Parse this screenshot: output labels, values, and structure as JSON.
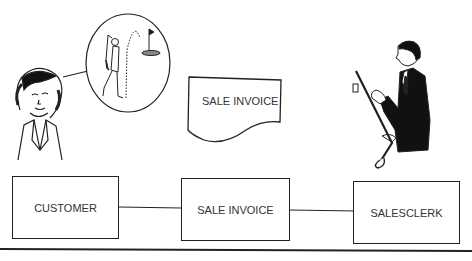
{
  "diagram": {
    "document_symbol": {
      "label": "SALE INVOICE"
    },
    "entities": [
      {
        "id": "customer",
        "label": "CUSTOMER"
      },
      {
        "id": "sale-invoice",
        "label": "SALE INVOICE"
      },
      {
        "id": "salesclerk",
        "label": "SALESCLERK"
      }
    ],
    "illustrations": [
      {
        "id": "customer-woman",
        "icon": "woman-portrait-icon"
      },
      {
        "id": "golfer-thought-bubble",
        "icon": "golfer-icon"
      },
      {
        "id": "salesclerk-man",
        "icon": "salesman-with-golf-club-icon"
      }
    ],
    "colors": {
      "line": "#222222",
      "background": "#ffffff",
      "text": "#333333"
    }
  }
}
